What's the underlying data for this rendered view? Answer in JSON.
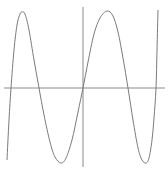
{
  "chart_data": {
    "type": "line",
    "title": "",
    "xlabel": "",
    "ylabel": "",
    "grid": false,
    "legend": null,
    "axes": {
      "x_axis_y_px": 88,
      "y_axis_x_px": 83,
      "x_range_px": [
        4,
        165
      ],
      "y_range_px": [
        7,
        167
      ]
    },
    "series": [
      {
        "name": "curve",
        "color": "#7a7a7a",
        "description": "Oscillating odd-symmetric function (quintic-like) crossing zero at five points, with two maxima and two minima",
        "points_px": [
          [
            7,
            160
          ],
          [
            9,
            120
          ],
          [
            11,
            88
          ],
          [
            14,
            50
          ],
          [
            17,
            25
          ],
          [
            20,
            14
          ],
          [
            22,
            12
          ],
          [
            25,
            14
          ],
          [
            29,
            30
          ],
          [
            34,
            60
          ],
          [
            39,
            88
          ],
          [
            44,
            115
          ],
          [
            50,
            142
          ],
          [
            55,
            157
          ],
          [
            61,
            163
          ],
          [
            66,
            158
          ],
          [
            72,
            140
          ],
          [
            78,
            112
          ],
          [
            83,
            88
          ],
          [
            88,
            62
          ],
          [
            94,
            34
          ],
          [
            100,
            18
          ],
          [
            107,
            11
          ],
          [
            113,
            16
          ],
          [
            118,
            32
          ],
          [
            123,
            58
          ],
          [
            128,
            88
          ],
          [
            133,
            120
          ],
          [
            138,
            148
          ],
          [
            142,
            160
          ],
          [
            146,
            163
          ],
          [
            149,
            158
          ],
          [
            152,
            140
          ],
          [
            154,
            118
          ],
          [
            156,
            88
          ],
          [
            157,
            50
          ],
          [
            158,
            10
          ]
        ],
        "zero_crossings_px": [
          11,
          39,
          83,
          128,
          156
        ],
        "maxima_px": [
          [
            22,
            12
          ],
          [
            107,
            11
          ]
        ],
        "minima_px": [
          [
            61,
            163
          ],
          [
            146,
            163
          ]
        ]
      }
    ]
  }
}
